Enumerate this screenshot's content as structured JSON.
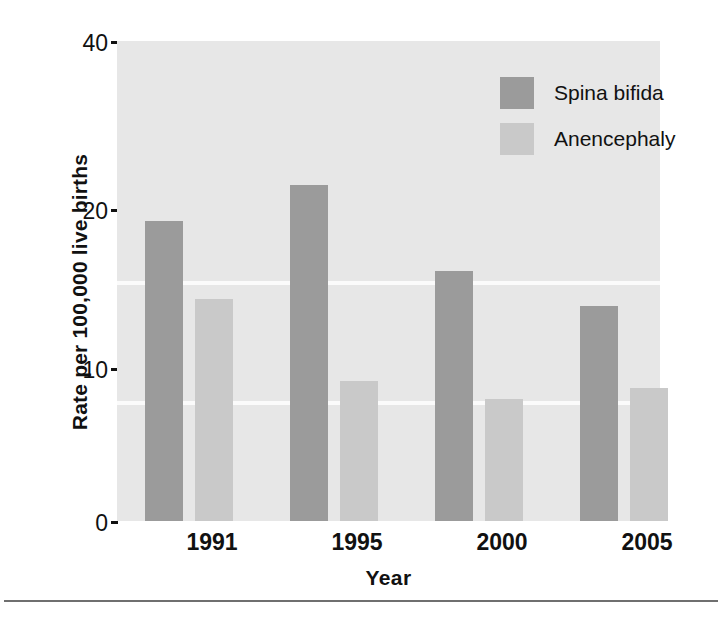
{
  "chart_data": {
    "type": "bar",
    "title": "",
    "xlabel": "Year",
    "ylabel": "Rate per 100,000 live births",
    "categories": [
      "1991",
      "1995",
      "2000",
      "2005"
    ],
    "series": [
      {
        "name": "Spina bifida",
        "color": "#9b9b9b",
        "values": [
          25.0,
          28.0,
          20.8,
          17.9
        ]
      },
      {
        "name": "Anencephaly",
        "color": "#c9c9c9",
        "values": [
          18.5,
          11.7,
          10.2,
          11.1
        ]
      }
    ],
    "ylim": [
      0,
      40
    ],
    "yticks": [
      "0",
      "10",
      "20",
      "40"
    ],
    "ytick_values": [
      0,
      10,
      20,
      40
    ],
    "gridlines": [
      10,
      20
    ],
    "grid": true,
    "grid_color": "#fbfbfb",
    "plot_background": "#e7e7e7",
    "legend_position": "top-right"
  },
  "axes": {
    "y_title": "Rate per 100,000 live births",
    "x_title": "Year",
    "tick_0": "0",
    "tick_10": "10",
    "tick_20": "20",
    "tick_40": "40"
  },
  "legend": {
    "items": [
      {
        "label": "Spina bifida",
        "color": "#9b9b9b"
      },
      {
        "label": "Anencephaly",
        "color": "#c9c9c9"
      }
    ]
  },
  "x_labels": [
    "1991",
    "1995",
    "2000",
    "2005"
  ]
}
